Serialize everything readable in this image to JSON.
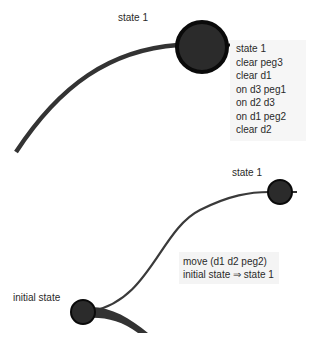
{
  "top_view": {
    "node_label": "state 1",
    "tooltip": {
      "title": "state 1",
      "facts": [
        "clear peg3",
        "clear d1",
        "on d3 peg1",
        "on d2 d3",
        "on d1 peg2",
        "clear d2"
      ]
    }
  },
  "bottom_view": {
    "target_node_label": "state 1",
    "source_node_label": "initial state",
    "edge_label": {
      "action": "move (d1 d2 peg2)",
      "transition": "initial state ⇒ state 1"
    }
  },
  "colors": {
    "node_fill": "#2b2b2b",
    "node_stroke": "#0a0a0a",
    "edge": "#333333",
    "tooltip_bg": "#f6f6f6"
  }
}
